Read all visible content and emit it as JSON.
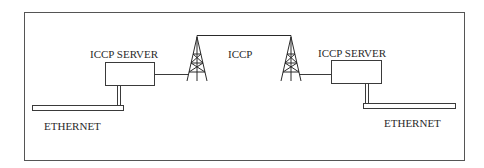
{
  "diagram": {
    "colors": {
      "stroke": "#3a3a3a",
      "frame": "#555555",
      "background": "#ffffff"
    },
    "nodes": [
      {
        "id": "left-server",
        "label": "ICCP SERVER",
        "type": "server"
      },
      {
        "id": "left-tower",
        "label": "",
        "type": "tower"
      },
      {
        "id": "right-tower",
        "label": "",
        "type": "tower"
      },
      {
        "id": "right-server",
        "label": "ICCP SERVER",
        "type": "server"
      },
      {
        "id": "left-ethernet",
        "label": "ETHERNET",
        "type": "bus"
      },
      {
        "id": "right-ethernet",
        "label": "ETHERNET",
        "type": "bus"
      }
    ],
    "links": [
      {
        "from": "left-server",
        "to": "left-tower",
        "label": ""
      },
      {
        "from": "left-tower",
        "to": "right-tower",
        "label": "ICCP"
      },
      {
        "from": "right-tower",
        "to": "right-server",
        "label": ""
      },
      {
        "from": "left-server",
        "to": "left-ethernet",
        "label": ""
      },
      {
        "from": "right-server",
        "to": "right-ethernet",
        "label": ""
      }
    ],
    "labels": {
      "left_server": "ICCP SERVER",
      "right_server": "ICCP SERVER",
      "link": "ICCP",
      "left_ethernet": "ETHERNET",
      "right_ethernet": "ETHERNET"
    }
  }
}
